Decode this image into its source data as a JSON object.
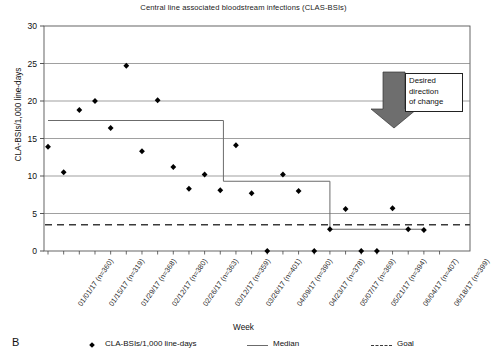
{
  "chart_data": {
    "type": "scatter",
    "title": "Central line associated bloodstream infections (CLAS-BSIs)",
    "xlabel": "Week",
    "ylabel": "CLA-BSIs/1,000 line-days",
    "ylim": [
      0,
      30
    ],
    "yticks": [
      0,
      5,
      10,
      15,
      20,
      25,
      30
    ],
    "grid": true,
    "legend_position": "bottom",
    "panel_label": "B",
    "categories": [
      "01/01/17 (n=360)",
      "01/15/17 (n=319)",
      "01/29/17 (n=368)",
      "02/12/17 (n=380)",
      "02/26/17 (n=363)",
      "03/12/17 (n=359)",
      "03/26/17 (n=401)",
      "04/09/17 (n=390)",
      "04/23/17 (n=378)",
      "05/07/17 (n=369)",
      "05/21/17 (n=394)",
      "06/04/17 (n=407)",
      "06/18/17 (n=399)"
    ],
    "series": [
      {
        "name": "CLA-BSIs/1,000 line-days",
        "type": "scatter",
        "marker": "diamond",
        "color": "#000000",
        "x": [
          0.0,
          0.5,
          1.0,
          1.5,
          2.0,
          2.5,
          3.0,
          3.5,
          4.0,
          4.5,
          5.0,
          5.5,
          6.0,
          6.5,
          7.0,
          7.5,
          8.0,
          8.5,
          9.0,
          9.5,
          10.0,
          10.5,
          11.0,
          11.5,
          12.0
        ],
        "values": [
          13.9,
          10.5,
          18.8,
          20.0,
          16.4,
          24.7,
          13.3,
          20.1,
          11.2,
          8.3,
          10.2,
          8.1,
          14.1,
          7.7,
          0.0,
          10.2,
          8.0,
          0.0,
          2.9,
          5.6,
          0.0,
          0.0,
          5.7,
          2.9,
          2.8
        ]
      },
      {
        "name": "Median",
        "type": "step",
        "style": "solid",
        "color": "#6b6b6b",
        "segments": [
          {
            "x_start": 0.0,
            "x_end": 5.6,
            "value": 17.4
          },
          {
            "x_start": 5.6,
            "x_end": 9.0,
            "value": 9.3
          },
          {
            "x_start": 9.0,
            "x_end": 12.0,
            "value": 2.9
          }
        ]
      },
      {
        "name": "Goal",
        "type": "line",
        "style": "dashed",
        "color": "#3a3a3a",
        "value": 3.5
      }
    ],
    "annotation": {
      "text_lines": [
        "Desired",
        "direction",
        "of change"
      ],
      "arrow": "down-arrow",
      "arrow_color": "#6e6e6e"
    }
  },
  "legend": {
    "items": [
      {
        "label": "CLA-BSIs/1,000 line-days",
        "marker": "diamond"
      },
      {
        "label": "Median",
        "marker": "solid-line"
      },
      {
        "label": "Goal",
        "marker": "dashed-line"
      }
    ]
  }
}
